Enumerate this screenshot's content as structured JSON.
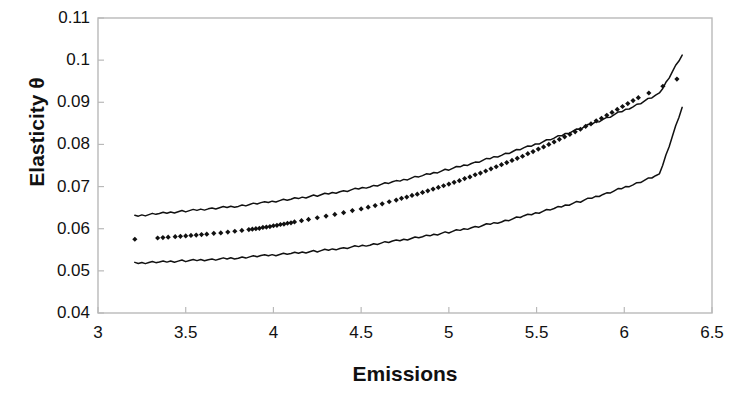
{
  "chart_data": {
    "type": "scatter",
    "title": "",
    "subtitle": "",
    "xlabel": "Emissions",
    "ylabel": "Elasticity θ",
    "xlim": [
      3,
      6.5
    ],
    "ylim": [
      0.04,
      0.11
    ],
    "xticks": [
      "3",
      "3.5",
      "4",
      "4.5",
      "5",
      "5.5",
      "6",
      "6.5"
    ],
    "xtick_values": [
      3,
      3.5,
      4,
      4.5,
      5,
      5.5,
      6,
      6.5
    ],
    "yticks": [
      "0.04",
      "0.05",
      "0.06",
      "0.07",
      "0.08",
      "0.09",
      "0.1",
      "0.11"
    ],
    "ytick_values": [
      0.04,
      0.05,
      0.06,
      0.07,
      0.08,
      0.09,
      0.1,
      0.11
    ],
    "grid": false,
    "legend": null,
    "legend_position": "none",
    "frame_color": "#b9b9b9",
    "marker_color": "#111111",
    "band_color": "#111111",
    "series": [
      {
        "name": "Elasticity estimate",
        "style": "scatter",
        "marker": "diamond",
        "x": [
          3.21,
          3.34,
          3.37,
          3.4,
          3.44,
          3.47,
          3.5,
          3.53,
          3.56,
          3.59,
          3.62,
          3.66,
          3.7,
          3.74,
          3.78,
          3.82,
          3.86,
          3.88,
          3.9,
          3.92,
          3.94,
          3.96,
          3.98,
          4.0,
          4.02,
          4.04,
          4.06,
          4.08,
          4.1,
          4.12,
          4.16,
          4.2,
          4.25,
          4.3,
          4.35,
          4.4,
          4.45,
          4.5,
          4.54,
          4.58,
          4.62,
          4.66,
          4.7,
          4.73,
          4.76,
          4.79,
          4.82,
          4.85,
          4.88,
          4.91,
          4.94,
          4.97,
          5.0,
          5.03,
          5.06,
          5.09,
          5.12,
          5.15,
          5.18,
          5.21,
          5.24,
          5.27,
          5.3,
          5.33,
          5.36,
          5.39,
          5.42,
          5.45,
          5.48,
          5.51,
          5.54,
          5.57,
          5.6,
          5.63,
          5.66,
          5.69,
          5.72,
          5.75,
          5.78,
          5.81,
          5.84,
          5.87,
          5.9,
          5.93,
          5.96,
          5.99,
          6.02,
          6.05,
          6.08,
          6.14,
          6.22,
          6.3
        ],
        "y": [
          0.0575,
          0.0578,
          0.0579,
          0.058,
          0.0581,
          0.0582,
          0.0583,
          0.0584,
          0.0585,
          0.0586,
          0.0587,
          0.0589,
          0.059,
          0.0592,
          0.0594,
          0.0596,
          0.0598,
          0.0599,
          0.06,
          0.0601,
          0.0603,
          0.0604,
          0.0605,
          0.0607,
          0.0608,
          0.061,
          0.0611,
          0.0613,
          0.0614,
          0.0616,
          0.0619,
          0.0622,
          0.0626,
          0.063,
          0.0634,
          0.0638,
          0.0643,
          0.0647,
          0.0651,
          0.0655,
          0.0659,
          0.0664,
          0.0668,
          0.0672,
          0.0675,
          0.0679,
          0.0682,
          0.0686,
          0.069,
          0.0694,
          0.0698,
          0.0702,
          0.0706,
          0.071,
          0.0714,
          0.0719,
          0.0723,
          0.0728,
          0.0732,
          0.0737,
          0.0742,
          0.0747,
          0.0752,
          0.0757,
          0.0762,
          0.0767,
          0.0772,
          0.0778,
          0.0783,
          0.0789,
          0.0794,
          0.08,
          0.0806,
          0.0812,
          0.0818,
          0.0824,
          0.083,
          0.0836,
          0.0843,
          0.0849,
          0.0856,
          0.0862,
          0.0869,
          0.0876,
          0.0883,
          0.089,
          0.0897,
          0.0904,
          0.0911,
          0.0922,
          0.0938,
          0.0955
        ]
      },
      {
        "name": "Upper confidence band",
        "style": "line",
        "x": [
          3.21,
          3.35,
          3.5,
          3.65,
          3.8,
          3.95,
          4.1,
          4.25,
          4.4,
          4.55,
          4.7,
          4.85,
          5.0,
          5.15,
          5.3,
          5.45,
          5.6,
          5.75,
          5.9,
          6.05,
          6.2,
          6.33
        ],
        "y": [
          0.063,
          0.0636,
          0.0642,
          0.0648,
          0.0654,
          0.0662,
          0.067,
          0.0679,
          0.0689,
          0.07,
          0.0712,
          0.0726,
          0.0741,
          0.0757,
          0.0775,
          0.0794,
          0.0815,
          0.0838,
          0.0863,
          0.089,
          0.092,
          0.1012
        ]
      },
      {
        "name": "Lower confidence band",
        "style": "line",
        "x": [
          3.21,
          3.35,
          3.5,
          3.65,
          3.8,
          3.95,
          4.1,
          4.25,
          4.4,
          4.55,
          4.7,
          4.85,
          5.0,
          5.15,
          5.3,
          5.45,
          5.6,
          5.75,
          5.9,
          6.05,
          6.2,
          6.33
        ],
        "y": [
          0.0518,
          0.0521,
          0.0524,
          0.0527,
          0.0531,
          0.0536,
          0.0541,
          0.0547,
          0.0554,
          0.0562,
          0.0571,
          0.0581,
          0.0592,
          0.0604,
          0.0617,
          0.0632,
          0.0648,
          0.0665,
          0.0684,
          0.0705,
          0.0728,
          0.0888
        ]
      }
    ]
  }
}
